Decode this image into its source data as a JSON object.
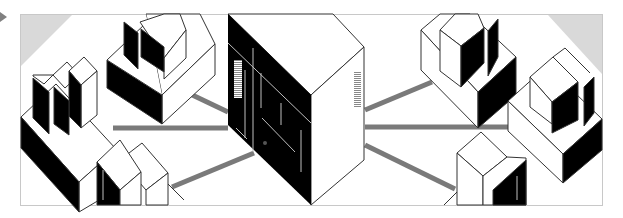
{
  "illustration": {
    "subject": "isometric network diagram: central server connected by cables to six workstations",
    "colors": {
      "frame": "#c8c8c8",
      "corner_shade": "#d9d9d9",
      "cable": "#7a7a7a",
      "ink": "#000000",
      "face": "#ffffff",
      "outline": "#333333",
      "marker": "#808080"
    },
    "nodes": [
      {
        "id": "server",
        "label": "server"
      },
      {
        "id": "ws-left-top",
        "label": "workstation"
      },
      {
        "id": "ws-left-mid",
        "label": "workstation"
      },
      {
        "id": "ws-left-bottom",
        "label": "workstation"
      },
      {
        "id": "ws-right-top",
        "label": "workstation"
      },
      {
        "id": "ws-right-mid",
        "label": "workstation"
      },
      {
        "id": "ws-right-bottom",
        "label": "workstation"
      }
    ],
    "connections": 6
  }
}
